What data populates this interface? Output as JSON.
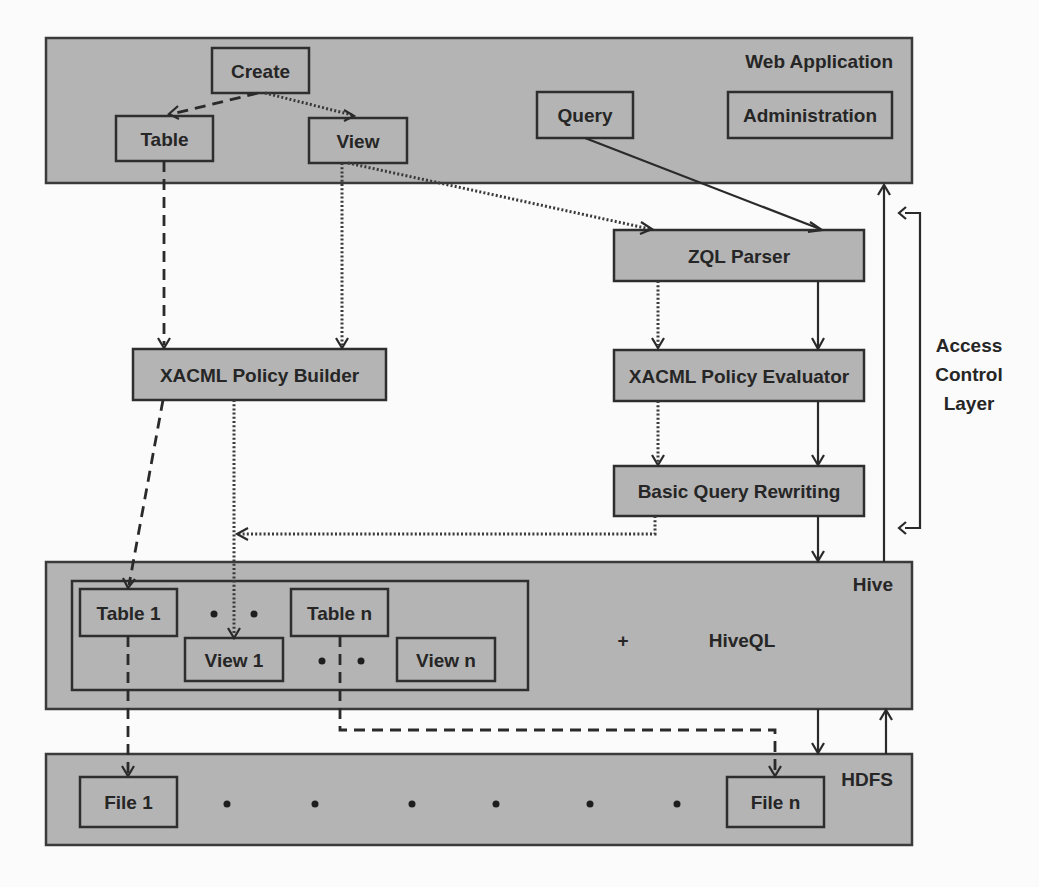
{
  "diagram": {
    "colors": {
      "layer_fill": "#b4b4b4",
      "stroke": "#2e2e2e",
      "background": "#fbfbfb",
      "text": "#262626"
    },
    "layers": {
      "web_application": {
        "title": "Web Application",
        "nodes": {
          "create": "Create",
          "table": "Table",
          "view": "View",
          "query": "Query",
          "administration": "Administration"
        }
      },
      "access_control": {
        "title_lines": [
          "Access",
          "Control",
          "Layer"
        ],
        "nodes": {
          "zql_parser": "ZQL Parser",
          "policy_evaluator": "XACML Policy Evaluator",
          "query_rewriting": "Basic Query Rewriting",
          "policy_builder": "XACML Policy Builder"
        }
      },
      "hive": {
        "title": "Hive",
        "nodes": {
          "table_1": "Table 1",
          "table_n": "Table n",
          "view_1": "View 1",
          "view_n": "View n"
        },
        "plus": "+",
        "hiveql": "HiveQL"
      },
      "hdfs": {
        "title": "HDFS",
        "nodes": {
          "file_1": "File 1",
          "file_n": "File n"
        }
      }
    },
    "edges": [
      {
        "from": "Create",
        "to": "Table",
        "style": "dashed"
      },
      {
        "from": "Create",
        "to": "View",
        "style": "dotted"
      },
      {
        "from": "Table",
        "to": "XACML Policy Builder",
        "style": "dashed"
      },
      {
        "from": "View",
        "to": "XACML Policy Builder",
        "style": "dotted"
      },
      {
        "from": "View",
        "to": "ZQL Parser",
        "style": "dotted"
      },
      {
        "from": "Query",
        "to": "ZQL Parser",
        "style": "solid"
      },
      {
        "from": "ZQL Parser",
        "to": "XACML Policy Evaluator",
        "style": "solid"
      },
      {
        "from": "ZQL Parser",
        "to": "XACML Policy Evaluator",
        "style": "dotted"
      },
      {
        "from": "XACML Policy Evaluator",
        "to": "Basic Query Rewriting",
        "style": "solid"
      },
      {
        "from": "XACML Policy Evaluator",
        "to": "Basic Query Rewriting",
        "style": "dotted"
      },
      {
        "from": "Basic Query Rewriting",
        "to": "XACML Policy Builder",
        "style": "dotted"
      },
      {
        "from": "Basic Query Rewriting",
        "to": "Hive",
        "style": "solid"
      },
      {
        "from": "Hive",
        "to": "Web Application",
        "style": "solid"
      },
      {
        "from": "XACML Policy Builder",
        "to": "Table 1",
        "style": "dashed"
      },
      {
        "from": "XACML Policy Builder",
        "to": "View 1",
        "style": "dotted"
      },
      {
        "from": "Table 1",
        "to": "File 1",
        "style": "dashed"
      },
      {
        "from": "Table n",
        "to": "File n",
        "style": "dashed"
      },
      {
        "from": "Hive",
        "to": "HDFS",
        "style": "solid"
      },
      {
        "from": "HDFS",
        "to": "Hive",
        "style": "solid"
      }
    ]
  }
}
